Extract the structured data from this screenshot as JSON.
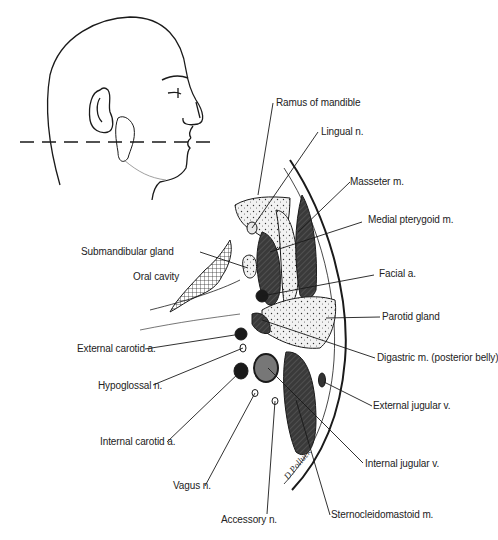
{
  "figure": {
    "orientation_inset": {
      "description": "Head in right lateral profile with parotid gland outlined and dashed section line",
      "section_line": "dashed horizontal line through ear lobe and mouth"
    },
    "labels": {
      "ramus_of_mandible": "Ramus of mandible",
      "lingual_n": "Lingual n.",
      "masseter_m": "Masseter m.",
      "medial_pterygoid_m": "Medial pterygoid m.",
      "submandibular_gland": "Submandibular gland",
      "oral_cavity": "Oral cavity",
      "facial_a": "Facial a.",
      "parotid_gland": "Parotid gland",
      "external_carotid_a": "External carotid a.",
      "digastric_m": "Digastric m. (posterior belly)",
      "hypoglossal_n": "Hypoglossal n.",
      "external_jugular_v": "External jugular v.",
      "internal_carotid_a": "Internal carotid a.",
      "internal_jugular_v": "Internal jugular v.",
      "vagus_n": "Vagus n.",
      "accessory_n": "Accessory n.",
      "sternocleidomastoid_m": "Sternocleidomastoid m."
    },
    "signature": "D.Polluck",
    "colors": {
      "ink": "#1a1a1a",
      "muscle_fill": "#3a3a3a",
      "vein_fill": "#777777",
      "background": "#ffffff"
    }
  }
}
